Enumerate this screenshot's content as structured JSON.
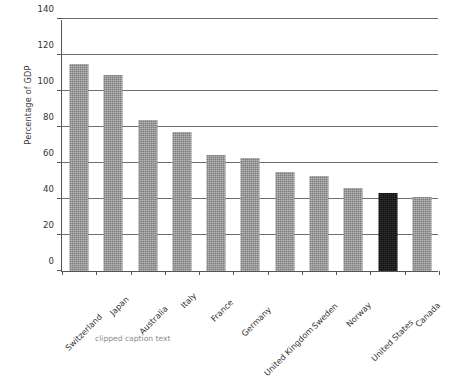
{
  "chart_data": {
    "type": "bar",
    "title": "",
    "xlabel": "",
    "ylabel": "Percentage of GDP",
    "ylim": [
      0,
      140
    ],
    "ytick_step": 20,
    "yticks": [
      0,
      20,
      40,
      60,
      80,
      100,
      120,
      140
    ],
    "ytick_labels": [
      "0",
      "20",
      "40",
      "60",
      "80",
      "100",
      "120",
      "140"
    ],
    "grid": "horizontal",
    "legend": "none",
    "categories": [
      "Switzerland",
      "Japan",
      "Australia",
      "Italy",
      "France",
      "Germany",
      "United Kingdom",
      "Sweden",
      "Norway",
      "United States",
      "Canada"
    ],
    "values": [
      115,
      109,
      84,
      77,
      64.5,
      63,
      55,
      53,
      46,
      43.5,
      41
    ],
    "highlight_category": "United States",
    "colors": {
      "bar": "#9a9a9a",
      "highlight_bar": "#141414",
      "gridline": "#6e6e6e",
      "axis": "#555555",
      "text": "#333333",
      "background": "#ffffff"
    }
  },
  "caption": {
    "text": "clipped caption text"
  }
}
